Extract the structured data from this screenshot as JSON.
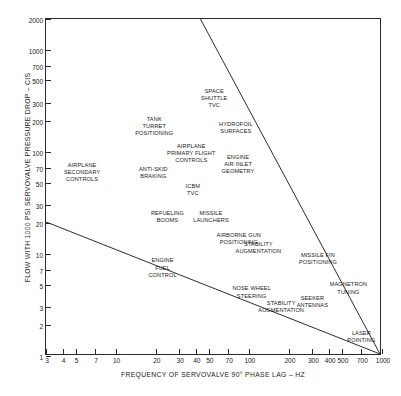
{
  "chart_data": {
    "type": "scatter",
    "title": "",
    "xlabel": "FREQUENCY OF SERVOVALVE 90° PHASE LAG – HZ",
    "ylabel": "FLOW WITH 1000 PSI SERVOVALVE PRESSURE DROP – CIS",
    "xscale": "log",
    "yscale": "log",
    "xlim": [
      3,
      1000
    ],
    "ylim": [
      1,
      2000
    ],
    "grid": false,
    "legend": null,
    "xticks": [
      3,
      4,
      5,
      7,
      10,
      20,
      30,
      40,
      50,
      70,
      100,
      200,
      300,
      400,
      500,
      700,
      1000
    ],
    "xticklabels": [
      "3",
      "4",
      "5",
      "7",
      "10",
      "20",
      "30",
      "40",
      "50",
      "70",
      "100",
      "200",
      "300",
      "400",
      "500",
      "700",
      "1000"
    ],
    "yticks": [
      1,
      2,
      3,
      5,
      7,
      10,
      20,
      30,
      50,
      70,
      100,
      200,
      300,
      500,
      700,
      1000,
      2000
    ],
    "yticklabels": [
      "1",
      "2",
      "3",
      "5",
      "7",
      "10",
      "20",
      "30",
      "50",
      "70",
      "100",
      "200",
      "300",
      "500",
      "700",
      "1000",
      "2000"
    ],
    "annotations": [
      {
        "text": "AIRPLANE\nSECONDARY\nCONTROLS",
        "x": 5.6,
        "y": 62
      },
      {
        "text": "TANK\nTURRET\nPOSITIONING",
        "x": 19.5,
        "y": 175
      },
      {
        "text": "ANTI-SKID\nBRAKING",
        "x": 19.2,
        "y": 62
      },
      {
        "text": "AIRPLANE\nPRIMARY FLIGHT\nCONTROLS",
        "x": 37,
        "y": 96
      },
      {
        "text": "SPACE\nSHUTTLE\nTVC",
        "x": 55,
        "y": 330
      },
      {
        "text": "HYDROFOIL\nSURFACES",
        "x": 80,
        "y": 170
      },
      {
        "text": "ENGINE\nAIR INLET\nGEOMETRY",
        "x": 83,
        "y": 75
      },
      {
        "text": "ICBM\nTVC",
        "x": 38,
        "y": 42
      },
      {
        "text": "REFUELING\nBOOMS",
        "x": 24.5,
        "y": 23
      },
      {
        "text": "MISSILE\nLAUNCHERS",
        "x": 52,
        "y": 23
      },
      {
        "text": "AIRBORNE GUN\nPOSITIONING",
        "x": 84,
        "y": 14
      },
      {
        "text": "STABILITY\nAUGMENTATION",
        "x": 118,
        "y": 11.5
      },
      {
        "text": "ENGINE\nFUEL\nCONTROL",
        "x": 22.5,
        "y": 7.2
      },
      {
        "text": "MISSILE FIN\nPOSITIONING",
        "x": 330,
        "y": 9.0
      },
      {
        "text": "NOSE WHEEL\nSTEERING",
        "x": 105,
        "y": 4.2
      },
      {
        "text": "STABILITY\nAUGMENTATION",
        "x": 175,
        "y": 3.0
      },
      {
        "text": "SEEKER\nANTENNAS",
        "x": 300,
        "y": 3.4
      },
      {
        "text": "MAGNETRON\nTUNING",
        "x": 560,
        "y": 4.6
      },
      {
        "text": "LASER\nPOINTING",
        "x": 700,
        "y": 1.55
      }
    ],
    "boundary_lines": [
      {
        "name": "upper-envelope",
        "x": [
          44,
          1000
        ],
        "y": [
          2000,
          1
        ]
      },
      {
        "name": "lower-envelope",
        "x": [
          3,
          1000
        ],
        "y": [
          20,
          1
        ]
      }
    ]
  }
}
